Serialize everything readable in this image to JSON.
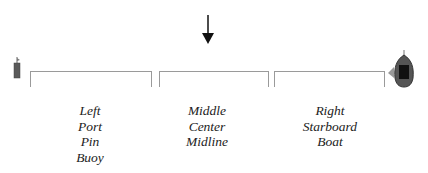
{
  "diagram": {
    "arrow": {
      "icon": "down-arrow-icon",
      "color": "#111111"
    },
    "pin_buoy": {
      "icon": "buoy-icon",
      "color": "#555555"
    },
    "committee_boat": {
      "icon": "boat-icon",
      "color": "#333333"
    },
    "sections": [
      {
        "name": "left",
        "labels": [
          "Left",
          "Port",
          "Pin",
          "Buoy"
        ]
      },
      {
        "name": "middle",
        "labels": [
          "Middle",
          "Center",
          "Midline"
        ]
      },
      {
        "name": "right",
        "labels": [
          "Right",
          "Starboard",
          "Boat"
        ]
      }
    ],
    "colors": {
      "bracket": "#9a9a9a",
      "text": "#222222",
      "background": "#ffffff"
    }
  }
}
